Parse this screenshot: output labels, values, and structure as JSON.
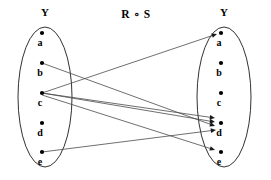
{
  "diagram": {
    "type": "set-relation-mapping-diagram",
    "relation_title": "R ∘ S",
    "background_color": "#ffffff",
    "stroke_color": "#1a1a1a",
    "edge_color": "#4a4a4a",
    "left_set": {
      "name": "left-set",
      "title": "Y",
      "center_x": 45,
      "center_y": 97,
      "rx": 27,
      "ry": 70,
      "nodes": [
        {
          "id": "a",
          "label": "a",
          "dot_x": 42,
          "dot_y": 33,
          "label_x": 40,
          "label_y": 46
        },
        {
          "id": "b",
          "label": "b",
          "dot_x": 42,
          "dot_y": 63,
          "label_x": 40,
          "label_y": 76
        },
        {
          "id": "c",
          "label": "c",
          "dot_x": 42,
          "dot_y": 93,
          "label_x": 40,
          "label_y": 106
        },
        {
          "id": "d",
          "label": "d",
          "dot_x": 42,
          "dot_y": 123,
          "label_x": 40,
          "label_y": 136
        },
        {
          "id": "e",
          "label": "e",
          "dot_x": 42,
          "dot_y": 152,
          "label_x": 40,
          "label_y": 165
        }
      ]
    },
    "right_set": {
      "name": "right-set",
      "title": "Y",
      "center_x": 224,
      "center_y": 97,
      "rx": 27,
      "ry": 70,
      "nodes": [
        {
          "id": "a",
          "label": "a",
          "dot_x": 221,
          "dot_y": 33,
          "label_x": 219,
          "label_y": 46
        },
        {
          "id": "b",
          "label": "b",
          "dot_x": 221,
          "dot_y": 63,
          "label_x": 219,
          "label_y": 76
        },
        {
          "id": "c",
          "label": "c",
          "dot_x": 221,
          "dot_y": 93,
          "label_x": 219,
          "label_y": 106
        },
        {
          "id": "d",
          "label": "d",
          "dot_x": 221,
          "dot_y": 123,
          "label_x": 219,
          "label_y": 136
        },
        {
          "id": "e",
          "label": "e",
          "dot_x": 221,
          "dot_y": 152,
          "label_x": 219,
          "label_y": 165
        }
      ]
    },
    "titles": {
      "left_title_x": 45,
      "left_title_y": 16,
      "right_title_x": 224,
      "right_title_y": 16,
      "relation_title_x": 136,
      "relation_title_y": 18
    },
    "edges": [
      {
        "id": "edge-c-a",
        "from": "c",
        "to": "a",
        "x1": 42,
        "y1": 93,
        "x2": 217,
        "y2": 34
      },
      {
        "id": "edge-b-d1",
        "from": "b",
        "to": "d",
        "x1": 42,
        "y1": 63,
        "x2": 215,
        "y2": 126
      },
      {
        "id": "edge-c-d1",
        "from": "c",
        "to": "d",
        "x1": 42,
        "y1": 93,
        "x2": 215,
        "y2": 118
      },
      {
        "id": "edge-c-d2",
        "from": "c",
        "to": "d",
        "x1": 42,
        "y1": 93,
        "x2": 215,
        "y2": 122
      },
      {
        "id": "edge-e-d",
        "from": "e",
        "to": "d",
        "x1": 42,
        "y1": 152,
        "x2": 216,
        "y2": 130
      },
      {
        "id": "edge-c-e",
        "from": "c",
        "to": "e",
        "x1": 42,
        "y1": 95,
        "x2": 215,
        "y2": 150
      }
    ],
    "edge_list_text": [
      "(c, a)",
      "(b, d)",
      "(c, d)",
      "(c, d)",
      "(e, d)",
      "(c, e)"
    ]
  }
}
